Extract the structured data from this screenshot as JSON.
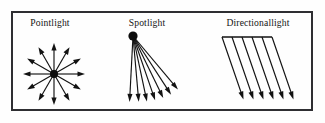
{
  "figure": {
    "background_color": "#fefefe",
    "ink_color": "#121212",
    "frame": {
      "name": "outer-border",
      "color": "#2e2e32",
      "x": 12,
      "y": 12,
      "width": 300,
      "height": 98,
      "stroke_width": 2
    }
  },
  "panels": [
    {
      "id": "pointlight",
      "label": "Pointlight",
      "label_x": 50,
      "label_y": 26,
      "type": "point",
      "origin": {
        "x": 54,
        "y": 74
      },
      "dot_radius": 4.0,
      "ray_count": 12,
      "ray_length": 31,
      "ray_angles_deg": [
        0,
        30,
        60,
        90,
        120,
        150,
        180,
        210,
        240,
        270,
        300,
        330
      ],
      "arrow_head_length": 7.5,
      "arrow_head_width": 5.2
    },
    {
      "id": "spotlight",
      "label": "Spotlight",
      "label_x": 147,
      "label_y": 26,
      "type": "spot",
      "origin": {
        "x": 133,
        "y": 36
      },
      "dot_radius": 4.6,
      "ray_count": 7,
      "ray_angles_deg": [
        50,
        57,
        64,
        71,
        78,
        85,
        93
      ],
      "ray_lengths": [
        70,
        70,
        69,
        68,
        67,
        66,
        66
      ],
      "arrow_head_length": 8.0,
      "arrow_head_width": 5.0
    },
    {
      "id": "directionallight",
      "label": "Directionallight",
      "label_x": 258,
      "label_y": 26,
      "type": "directional",
      "plane_bar": {
        "x1": 222,
        "y1": 37,
        "x2": 272,
        "y2": 37
      },
      "ray_count": 6,
      "ray_angle_deg": 71,
      "ray_length": 66,
      "ray_start_xs": [
        222,
        232,
        242,
        252,
        262,
        272
      ],
      "ray_start_y": 37,
      "arrow_head_length": 8.0,
      "arrow_head_width": 5.0
    }
  ]
}
